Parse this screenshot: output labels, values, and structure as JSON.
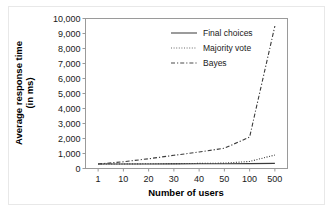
{
  "chart_data": {
    "type": "line",
    "title": "",
    "xlabel": "Number of users",
    "ylabel": "Average response time (in ms)",
    "ylabel_line1": "Average response time",
    "ylabel_line2": "(in ms)",
    "categories": [
      "1",
      "10",
      "20",
      "30",
      "40",
      "50",
      "100",
      "500"
    ],
    "yticks": [
      "0",
      "1,000",
      "2,000",
      "3,000",
      "4,000",
      "5,000",
      "6,000",
      "7,000",
      "8,000",
      "9,000",
      "10,000"
    ],
    "ylim": [
      0,
      10000
    ],
    "grid": false,
    "legend_position": "top-center",
    "series": [
      {
        "name": "Final choices",
        "style": "solid",
        "color": "#4a4a4a",
        "values": [
          300,
          300,
          305,
          310,
          312,
          315,
          325,
          340
        ]
      },
      {
        "name": "Majority vote",
        "style": "dotted",
        "color": "#6a6a6a",
        "values": [
          300,
          305,
          315,
          325,
          340,
          360,
          470,
          900
        ]
      },
      {
        "name": "Bayes",
        "style": "dashed",
        "color": "#4a4a4a",
        "values": [
          300,
          450,
          650,
          880,
          1100,
          1350,
          2100,
          9500
        ]
      }
    ]
  },
  "legend": {
    "items": [
      {
        "label": "Final choices",
        "style": "solid"
      },
      {
        "label": "Majority vote",
        "style": "dotted"
      },
      {
        "label": "Bayes",
        "style": "dashed"
      }
    ]
  },
  "colors": {
    "axis": "#9a9a9a",
    "text": "#1a1a1a",
    "background": "#ffffff",
    "series_dark": "#4a4a4a",
    "series_light": "#6a6a6a"
  }
}
